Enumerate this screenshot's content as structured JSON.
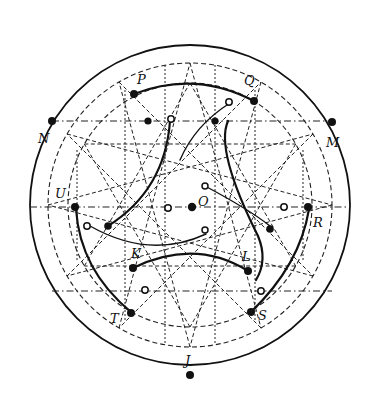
{
  "diagram": {
    "labels": [
      {
        "id": "P",
        "text": "P"
      },
      {
        "id": "Q",
        "text": "Q"
      },
      {
        "id": "N",
        "text": "N"
      },
      {
        "id": "M",
        "text": "M"
      },
      {
        "id": "U",
        "text": "U"
      },
      {
        "id": "O",
        "text": "O"
      },
      {
        "id": "R",
        "text": "R"
      },
      {
        "id": "K",
        "text": "K"
      },
      {
        "id": "L",
        "text": "L"
      },
      {
        "id": "T",
        "text": "T"
      },
      {
        "id": "S",
        "text": "S"
      },
      {
        "id": "J",
        "text": "J"
      }
    ],
    "point_types": {
      "filled": "solid-dot",
      "hollow": "open-dot"
    },
    "stroke_color": "#111111",
    "background": "#ffffff"
  }
}
